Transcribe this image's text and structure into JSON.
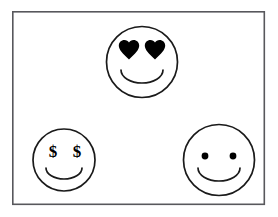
{
  "scene": {
    "title": "Three smiley faces",
    "background_color": "#ffffff",
    "frame": {
      "name": "border-frame",
      "x": 12,
      "y": 11,
      "width": 253,
      "height": 194,
      "stroke_color": "#58585c",
      "fill_color": "#ffffff"
    },
    "stroke_color": "#1a1a1a",
    "ink_color": "#000000"
  },
  "faces": [
    {
      "id": "heart-eyes-face",
      "label": "Heart eyes smiley face",
      "position": "top-center",
      "cx": 142,
      "cy": 62,
      "r": 36,
      "eye_type": "heart",
      "eyes": [
        {
          "cx": 129,
          "cy": 51,
          "size": 19
        },
        {
          "cx": 155,
          "cy": 51,
          "size": 19
        }
      ],
      "mouth": {
        "cx": 142,
        "cy": 70,
        "rx": 21,
        "ry": 13
      }
    },
    {
      "id": "money-eyes-face",
      "label": "Dollar sign eyes smiley face",
      "position": "bottom-left",
      "cx": 64,
      "cy": 160,
      "r": 31,
      "eye_type": "dollar",
      "eye_symbol": "$",
      "eyes": [
        {
          "cx": 53,
          "cy": 152
        },
        {
          "cx": 77,
          "cy": 152
        }
      ],
      "mouth": {
        "cx": 64,
        "cy": 168,
        "rx": 18,
        "ry": 11
      }
    },
    {
      "id": "dot-eyes-face",
      "label": "Dot eyes smiley face",
      "position": "bottom-right",
      "cx": 219,
      "cy": 160,
      "r": 36,
      "eye_type": "dot",
      "eyes": [
        {
          "cx": 205,
          "cy": 156,
          "r": 3.4
        },
        {
          "cx": 233,
          "cy": 156,
          "r": 3.4
        }
      ],
      "mouth": {
        "cx": 219,
        "cy": 168,
        "rx": 21,
        "ry": 13
      }
    }
  ]
}
